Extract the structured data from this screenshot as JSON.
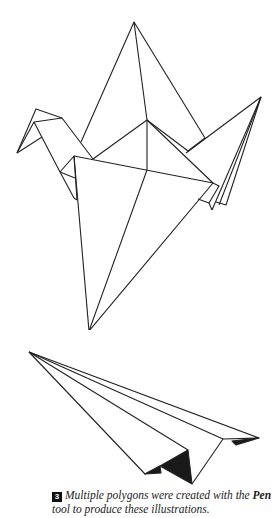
{
  "illustrations": [
    {
      "name": "origami-crane",
      "description": "line-art polygon crane"
    },
    {
      "name": "paper-airplane",
      "description": "line-art polygon paper airplane"
    }
  ],
  "caption": {
    "figure_number": "3",
    "text_before": "Multiple polygons were created with the ",
    "tool_name": "Pen",
    "text_after": " tool to produce these illustrations."
  },
  "colors": {
    "stroke": "#222222",
    "fill_dark": "#1a1a1a",
    "background": "#ffffff"
  }
}
